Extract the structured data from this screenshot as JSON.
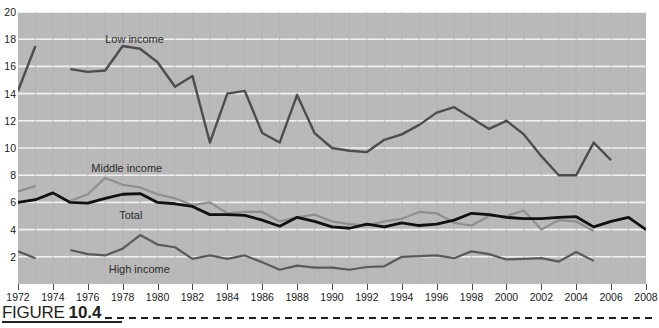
{
  "figure": {
    "word": "FIGURE",
    "number": "10.4"
  },
  "chart_data": {
    "type": "line",
    "title": "",
    "subtitle": "",
    "xlabel": "",
    "ylabel": "",
    "xlim": [
      1972,
      2008
    ],
    "ylim": [
      0,
      20
    ],
    "yticks": [
      2,
      4,
      6,
      8,
      10,
      12,
      14,
      16,
      18,
      20
    ],
    "xticks": [
      1972,
      1974,
      1976,
      1978,
      1980,
      1982,
      1984,
      1986,
      1988,
      1990,
      1992,
      1994,
      1996,
      1998,
      2000,
      2002,
      2004,
      2006,
      2008
    ],
    "grid": true,
    "grid_axis": "y",
    "legend": "inline-labels",
    "plot_background": "#b9b9b9",
    "gridline_color": "#f2f2f2",
    "series": [
      {
        "name": "Low income",
        "color": "#4d4d4d",
        "width": 2.4,
        "label_x": 1977.0,
        "label_y": 18.0,
        "points": [
          [
            1972,
            14.2
          ],
          [
            1973,
            17.5
          ],
          [
            null,
            null
          ],
          [
            1975,
            15.8
          ],
          [
            1976,
            15.6
          ],
          [
            1977,
            15.7
          ],
          [
            1978,
            17.5
          ],
          [
            1979,
            17.3
          ],
          [
            1980,
            16.3
          ],
          [
            1981,
            14.5
          ],
          [
            1982,
            15.3
          ],
          [
            1983,
            10.4
          ],
          [
            1984,
            14.0
          ],
          [
            1985,
            14.2
          ],
          [
            1986,
            11.1
          ],
          [
            1987,
            10.4
          ],
          [
            1988,
            13.9
          ],
          [
            1989,
            11.1
          ],
          [
            1990,
            10.0
          ],
          [
            1991,
            9.8
          ],
          [
            1992,
            9.7
          ],
          [
            1993,
            10.6
          ],
          [
            1994,
            11.0
          ],
          [
            1995,
            11.7
          ],
          [
            1996,
            12.6
          ],
          [
            1997,
            13.0
          ],
          [
            1998,
            12.2
          ],
          [
            1999,
            11.4
          ],
          [
            2000,
            12.0
          ],
          [
            2001,
            11.0
          ],
          [
            2002,
            9.4
          ],
          [
            2003,
            8.0
          ],
          [
            2004,
            8.0
          ],
          [
            2005,
            10.4
          ],
          [
            2006,
            9.1
          ]
        ]
      },
      {
        "name": "Middle income",
        "color": "#8f8f8f",
        "width": 2.2,
        "label_x": 1976.2,
        "label_y": 8.5,
        "points": [
          [
            1972,
            6.8
          ],
          [
            1973,
            7.2
          ],
          [
            null,
            null
          ],
          [
            1975,
            6.1
          ],
          [
            1976,
            6.6
          ],
          [
            1977,
            7.8
          ],
          [
            1978,
            7.3
          ],
          [
            1979,
            7.1
          ],
          [
            1980,
            6.6
          ],
          [
            1981,
            6.3
          ],
          [
            1982,
            5.8
          ],
          [
            1983,
            6.0
          ],
          [
            1984,
            5.2
          ],
          [
            1985,
            5.3
          ],
          [
            1986,
            5.3
          ],
          [
            1987,
            4.6
          ],
          [
            1988,
            4.9
          ],
          [
            1989,
            5.1
          ],
          [
            1990,
            4.6
          ],
          [
            1991,
            4.4
          ],
          [
            1992,
            4.3
          ],
          [
            1993,
            4.6
          ],
          [
            1994,
            4.8
          ],
          [
            1995,
            5.3
          ],
          [
            1996,
            5.2
          ],
          [
            1997,
            4.5
          ],
          [
            1998,
            4.3
          ],
          [
            1999,
            5.0
          ],
          [
            2000,
            5.0
          ],
          [
            2001,
            5.4
          ],
          [
            2002,
            4.0
          ],
          [
            2003,
            4.7
          ],
          [
            2004,
            4.6
          ],
          [
            2005,
            3.9
          ]
        ]
      },
      {
        "name": "Total",
        "color": "#111111",
        "width": 2.8,
        "label_x": 1977.8,
        "label_y": 5.1,
        "points": [
          [
            1972,
            6.0
          ],
          [
            1973,
            6.2
          ],
          [
            1974,
            6.7
          ],
          [
            1975,
            6.0
          ],
          [
            1976,
            5.95
          ],
          [
            1977,
            6.3
          ],
          [
            1978,
            6.6
          ],
          [
            1979,
            6.65
          ],
          [
            1980,
            6.0
          ],
          [
            1981,
            5.9
          ],
          [
            1982,
            5.7
          ],
          [
            1983,
            5.1
          ],
          [
            1984,
            5.1
          ],
          [
            1985,
            5.05
          ],
          [
            1986,
            4.7
          ],
          [
            1987,
            4.25
          ],
          [
            1988,
            4.9
          ],
          [
            1989,
            4.6
          ],
          [
            1990,
            4.2
          ],
          [
            1991,
            4.1
          ],
          [
            1992,
            4.4
          ],
          [
            1993,
            4.2
          ],
          [
            1994,
            4.5
          ],
          [
            1995,
            4.3
          ],
          [
            1996,
            4.4
          ],
          [
            1997,
            4.7
          ],
          [
            1998,
            5.2
          ],
          [
            1999,
            5.1
          ],
          [
            2000,
            4.9
          ],
          [
            2001,
            4.8
          ],
          [
            2002,
            4.8
          ],
          [
            2003,
            4.9
          ],
          [
            2004,
            4.95
          ],
          [
            2005,
            4.2
          ],
          [
            2006,
            4.6
          ],
          [
            2007,
            4.9
          ],
          [
            2008,
            4.0
          ]
        ]
      },
      {
        "name": "High income",
        "color": "#5a5a5a",
        "width": 2.2,
        "label_x": 1977.2,
        "label_y": 1.1,
        "points": [
          [
            1972,
            2.4
          ],
          [
            1973,
            1.9
          ],
          [
            null,
            null
          ],
          [
            1975,
            2.5
          ],
          [
            1976,
            2.2
          ],
          [
            1977,
            2.1
          ],
          [
            1978,
            2.6
          ],
          [
            1979,
            3.6
          ],
          [
            1980,
            2.9
          ],
          [
            1981,
            2.7
          ],
          [
            1982,
            1.85
          ],
          [
            1983,
            2.1
          ],
          [
            1984,
            1.85
          ],
          [
            1985,
            2.1
          ],
          [
            1986,
            1.6
          ],
          [
            1987,
            1.05
          ],
          [
            1988,
            1.35
          ],
          [
            1989,
            1.2
          ],
          [
            1990,
            1.2
          ],
          [
            1991,
            1.05
          ],
          [
            1992,
            1.25
          ],
          [
            1993,
            1.3
          ],
          [
            1994,
            2.0
          ],
          [
            1995,
            2.05
          ],
          [
            1996,
            2.1
          ],
          [
            1997,
            1.9
          ],
          [
            1998,
            2.4
          ],
          [
            1999,
            2.2
          ],
          [
            2000,
            1.8
          ],
          [
            2001,
            1.85
          ],
          [
            2002,
            1.9
          ],
          [
            2003,
            1.65
          ],
          [
            2004,
            2.35
          ],
          [
            2005,
            1.7
          ]
        ]
      }
    ]
  }
}
